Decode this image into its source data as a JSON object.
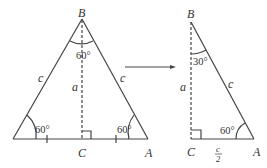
{
  "colors": {
    "stroke": "#444444",
    "text": "#333333",
    "background": "#ffffff"
  },
  "left_triangle": {
    "vertices": {
      "B": "B",
      "C": "C",
      "A": "A"
    },
    "side_labels": {
      "left": "c",
      "right": "c",
      "altitude": "a"
    },
    "angles": {
      "top": "60°",
      "bottom_left": "60°",
      "bottom_right": "60°"
    }
  },
  "arrow": {
    "direction": "right"
  },
  "right_triangle": {
    "vertices": {
      "B": "B",
      "C": "C",
      "A": "A"
    },
    "side_labels": {
      "altitude": "a",
      "hypotenuse": "c",
      "base_num": "c",
      "base_den": "2"
    },
    "angles": {
      "top": "30°",
      "bottom_right": "60°"
    }
  }
}
